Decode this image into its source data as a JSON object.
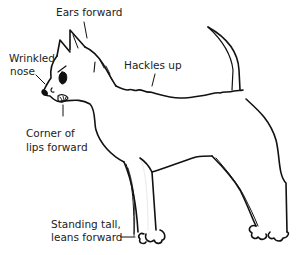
{
  "diagram": {
    "labels": {
      "ears": "Ears forward",
      "nose_line1": "Wrinkled",
      "nose_line2": "nose",
      "hackles": "Hackles up",
      "lips_line1": "Corner of",
      "lips_line2": "lips forward",
      "stance_line1": "Standing tall,",
      "stance_line2": "leans forward"
    },
    "colors": {
      "ink": "#111111",
      "text": "#222222",
      "background": "#ffffff"
    }
  }
}
